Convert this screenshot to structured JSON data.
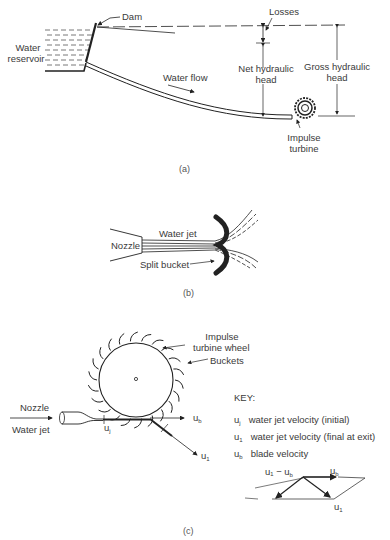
{
  "panel_a": {
    "caption": "(a)",
    "labels": {
      "dam": "Dam",
      "water_reservoir_1": "Water",
      "water_reservoir_2": "reservoir",
      "losses": "Losses",
      "water_flow": "Water flow",
      "net_head_1": "Net hydraulic",
      "net_head_2": "head",
      "gross_head_1": "Gross hydraulic",
      "gross_head_2": "head",
      "turbine_1": "Impulse",
      "turbine_2": "turbine"
    }
  },
  "panel_b": {
    "caption": "(b)",
    "labels": {
      "nozzle": "Nozzle",
      "water_jet": "Water jet",
      "split_bucket": "Split bucket"
    }
  },
  "panel_c": {
    "caption": "(c)",
    "labels": {
      "wheel_1": "Impulse",
      "wheel_2": "turbine wheel",
      "buckets": "Buckets",
      "nozzle": "Nozzle",
      "water_jet": "Water jet",
      "uj": "u",
      "uj_sub": "j",
      "ub": "u",
      "ub_sub": "b",
      "u1": "u",
      "u1_sub": "1"
    },
    "key": {
      "title": "KEY:",
      "items": [
        {
          "symbol": "u",
          "sub": "j",
          "text": "water jet velocity (initial)"
        },
        {
          "symbol": "u",
          "sub": "1",
          "text": "water jet velocity (final at exit)"
        },
        {
          "symbol": "u",
          "sub": "b",
          "text": "blade velocity"
        }
      ]
    },
    "vector_diagram": {
      "relative": "u₁ − u",
      "relative_sub": "b",
      "ub": "u",
      "ub_sub": "b",
      "u1": "u",
      "u1_sub": "1"
    }
  }
}
